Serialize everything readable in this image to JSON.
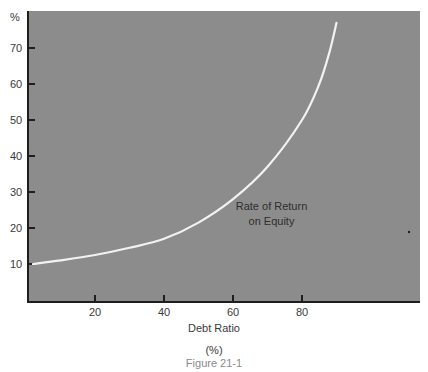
{
  "chart_data": {
    "type": "line",
    "title": "",
    "caption": "Figure 21-1",
    "xlabel": "Debt Ratio",
    "xlabel_unit": "(%)",
    "ylabel": "%",
    "xlim": [
      0,
      100
    ],
    "ylim": [
      0,
      80
    ],
    "x_ticks": [
      20,
      40,
      60,
      80
    ],
    "y_ticks": [
      10,
      20,
      30,
      40,
      50,
      60,
      70
    ],
    "grid": false,
    "legend": null,
    "series": [
      {
        "name": "Rate of Return on Equity",
        "x": [
          2,
          10,
          20,
          30,
          40,
          50,
          60,
          70,
          80,
          85,
          88,
          90
        ],
        "y": [
          10,
          11,
          12.5,
          14.5,
          17,
          21.5,
          28,
          37,
          50,
          60,
          69,
          77
        ]
      }
    ],
    "annotations": [
      {
        "text_line1": "Rate of Return",
        "text_line2": "on Equity",
        "x": 70,
        "y": 21
      }
    ],
    "colors": {
      "plot_background": "#8c8c8c",
      "line": "#f2f2f2",
      "axis": "#1e1e1e"
    }
  }
}
